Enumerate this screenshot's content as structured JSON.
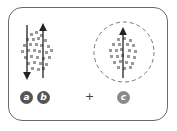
{
  "diagram": {
    "left_panel": {
      "arrows": [
        {
          "direction": "down"
        },
        {
          "direction": "up"
        }
      ],
      "labels": [
        "a",
        "b"
      ]
    },
    "operator": "+",
    "right_panel": {
      "arrows": [
        {
          "direction": "up"
        }
      ],
      "label": "c",
      "boundary": "dashed-circle"
    },
    "colors": {
      "frame": "#6a6a6a",
      "dots": "#9a9a9a",
      "arrow": "#222222",
      "badge_dark": "#555555",
      "badge_light": "#8a8a8a"
    }
  }
}
